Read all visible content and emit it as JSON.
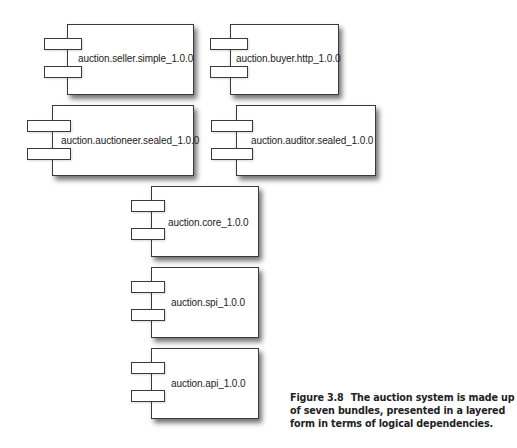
{
  "diagram": {
    "type": "component-diagram",
    "bundles": [
      {
        "id": "seller",
        "label": "auction.seller.simple_1.0.0",
        "layer": 1
      },
      {
        "id": "buyer",
        "label": "auction.buyer.http_1.0.0",
        "layer": 1
      },
      {
        "id": "auctioneer",
        "label": "auction.auctioneer.sealed_1.0.0",
        "layer": 2
      },
      {
        "id": "auditor",
        "label": "auction.auditor.sealed_1.0.0",
        "layer": 2
      },
      {
        "id": "core",
        "label": "auction.core_1.0.0",
        "layer": 3
      },
      {
        "id": "spi",
        "label": "auction.spi_1.0.0",
        "layer": 4
      },
      {
        "id": "api",
        "label": "auction.api_1.0.0",
        "layer": 5
      }
    ]
  },
  "caption": {
    "figure_number": "Figure 3.8",
    "text": "The auction system is made up of seven bundles, presented in a layered form in terms of logical dependencies."
  }
}
